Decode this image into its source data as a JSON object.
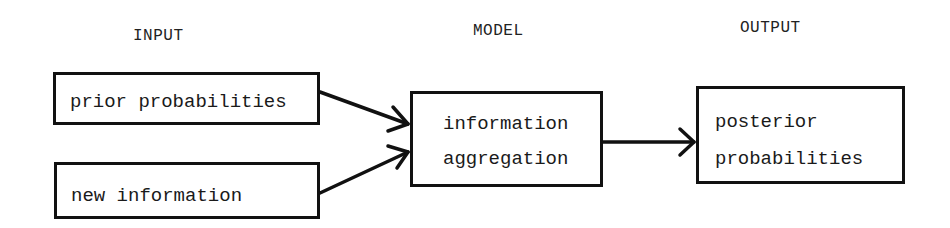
{
  "diagram": {
    "type": "flow",
    "columns": [
      {
        "id": "input",
        "heading": "INPUT"
      },
      {
        "id": "model",
        "heading": "MODEL"
      },
      {
        "id": "output",
        "heading": "OUTPUT"
      }
    ],
    "nodes": {
      "prior": {
        "label": "prior probabilities"
      },
      "new_info": {
        "label": "new information"
      },
      "aggregation": {
        "line1": "information",
        "line2": "aggregation"
      },
      "posterior": {
        "line1": "posterior",
        "line2": "probabilities"
      }
    },
    "edges": [
      {
        "from": "prior probabilities",
        "to": "information aggregation"
      },
      {
        "from": "new information",
        "to": "information aggregation"
      },
      {
        "from": "information aggregation",
        "to": "posterior probabilities"
      }
    ],
    "colors": {
      "stroke": "#111111",
      "background": "#ffffff",
      "text": "#1a1a1a"
    }
  }
}
